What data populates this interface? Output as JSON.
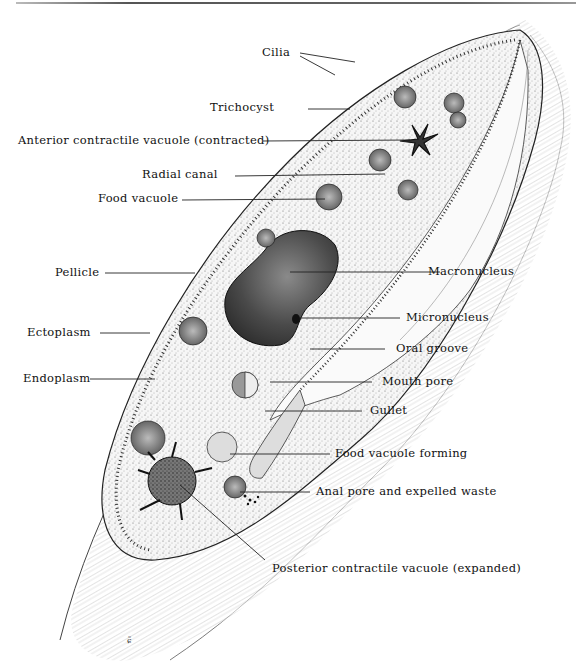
{
  "diagram": {
    "labels": [
      {
        "id": "cilia",
        "text": "Cilia"
      },
      {
        "id": "trichocyst",
        "text": "Trichocyst"
      },
      {
        "id": "anterior_cv",
        "text": "Anterior contractile vacuole (contracted)"
      },
      {
        "id": "radial_canal",
        "text": "Radial canal"
      },
      {
        "id": "food_vacuole",
        "text": "Food vacuole"
      },
      {
        "id": "pellicle",
        "text": "Pellicle"
      },
      {
        "id": "macronucleus",
        "text": "Macronucleus"
      },
      {
        "id": "micronucleus",
        "text": "Micronucleus"
      },
      {
        "id": "ectoplasm",
        "text": "Ectoplasm"
      },
      {
        "id": "oral_groove",
        "text": "Oral groove"
      },
      {
        "id": "endoplasm",
        "text": "Endoplasm"
      },
      {
        "id": "mouth_pore",
        "text": "Mouth pore"
      },
      {
        "id": "gullet",
        "text": "Gullet"
      },
      {
        "id": "food_vacuole_forming",
        "text": "Food vacuole forming"
      },
      {
        "id": "anal_pore",
        "text": "Anal pore and expelled waste"
      },
      {
        "id": "posterior_cv",
        "text": "Posterior contractile vacuole (expanded)"
      }
    ],
    "signature": "ɕ̃"
  }
}
